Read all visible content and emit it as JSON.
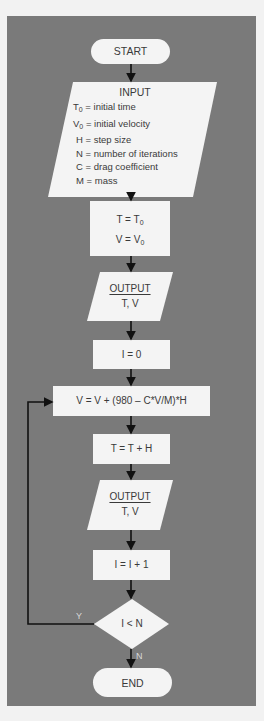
{
  "flowchart": {
    "start": "START",
    "input": {
      "title": "INPUT",
      "lines": [
        {
          "sym": "T",
          "sub": "0",
          "text": " = initial time"
        },
        {
          "sym": "V",
          "sub": "0",
          "text": " = initial velocity"
        },
        {
          "sym": "H",
          "sub": "",
          "text": " = step size"
        },
        {
          "sym": "N",
          "sub": "",
          "text": " = number of iterations"
        },
        {
          "sym": "C",
          "sub": "",
          "text": " = drag coefficient"
        },
        {
          "sym": "M",
          "sub": "",
          "text": " = mass"
        }
      ]
    },
    "init": {
      "line1": "T = T",
      "line1_sub": "0",
      "line2": "V = V",
      "line2_sub": "0"
    },
    "output1": {
      "title": "OUTPUT",
      "vars": "T, V"
    },
    "counter_init": "I = 0",
    "velocity_update": "V = V + (980 – C*V/M)*H",
    "time_update": "T = T + H",
    "output2": {
      "title": "OUTPUT",
      "vars": "T, V"
    },
    "counter_inc": "I = I + 1",
    "decision": "I < N",
    "yes_label": "Y",
    "no_label": "N",
    "end": "END"
  },
  "colors": {
    "panel": "#7a7a7a",
    "shape": "#f4f4f4",
    "line": "#111111",
    "text": "#3a3a3a"
  }
}
